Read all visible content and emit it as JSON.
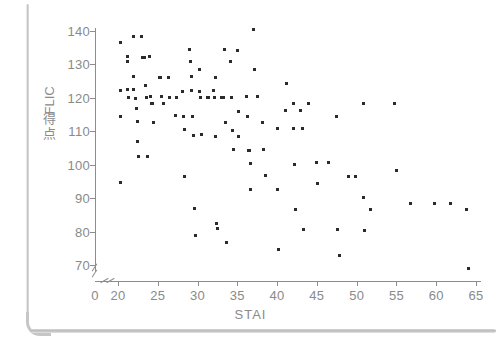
{
  "figure": {
    "background_color": "#ffffff",
    "axis_color": "#8d8d8d",
    "point_color": "#2b2b2b",
    "tick_label_color": "#8a8a8a"
  },
  "y_axis_title": {
    "rotated_part": "FLIC",
    "plain_part": "得点"
  },
  "chart_data": {
    "type": "scatter",
    "title": "",
    "subtitle": "",
    "xlabel": "STAI",
    "ylabel": "FLIC得点",
    "xlim": [
      0,
      65
    ],
    "ylim": [
      66,
      142
    ],
    "x_ticks": [
      0,
      20,
      25,
      30,
      35,
      40,
      45,
      50,
      55,
      60,
      65
    ],
    "y_ticks": [
      70,
      80,
      90,
      100,
      110,
      120,
      130,
      140
    ],
    "x_axis_break": true,
    "y_axis_break": true,
    "grid": false,
    "legend": false,
    "marker": "square-dot",
    "points": [
      [
        20.3,
        136.5
      ],
      [
        20.3,
        122.3
      ],
      [
        20.3,
        114.3
      ],
      [
        20.3,
        94.6
      ],
      [
        21.2,
        132.5
      ],
      [
        21.2,
        131.0
      ],
      [
        21.2,
        122.5
      ],
      [
        21.3,
        120.2
      ],
      [
        22.0,
        138.5
      ],
      [
        22.0,
        126.3
      ],
      [
        22.0,
        122.5
      ],
      [
        22.2,
        119.8
      ],
      [
        22.3,
        116.8
      ],
      [
        22.4,
        112.8
      ],
      [
        22.5,
        106.8
      ],
      [
        22.6,
        102.5
      ],
      [
        23.0,
        138.5
      ],
      [
        23.1,
        132.0
      ],
      [
        23.3,
        132.0
      ],
      [
        23.5,
        123.8
      ],
      [
        23.6,
        120.0
      ],
      [
        23.7,
        102.5
      ],
      [
        24.0,
        132.5
      ],
      [
        24.1,
        120.3
      ],
      [
        24.2,
        118.2
      ],
      [
        24.3,
        118.2
      ],
      [
        24.4,
        112.6
      ],
      [
        25.2,
        126.0
      ],
      [
        25.4,
        126.0
      ],
      [
        25.5,
        120.3
      ],
      [
        25.7,
        118.3
      ],
      [
        26.3,
        126.2
      ],
      [
        26.5,
        120.2
      ],
      [
        27.2,
        114.6
      ],
      [
        27.4,
        120.0
      ],
      [
        28.1,
        122.0
      ],
      [
        28.2,
        114.5
      ],
      [
        28.3,
        110.4
      ],
      [
        28.4,
        96.5
      ],
      [
        29.0,
        134.4
      ],
      [
        29.1,
        130.8
      ],
      [
        29.2,
        126.3
      ],
      [
        29.3,
        122.2
      ],
      [
        29.4,
        114.5
      ],
      [
        29.5,
        108.6
      ],
      [
        29.6,
        86.8
      ],
      [
        29.7,
        78.7
      ],
      [
        30.2,
        128.5
      ],
      [
        30.3,
        122.0
      ],
      [
        30.4,
        120.0
      ],
      [
        30.5,
        109.0
      ],
      [
        31.3,
        120.0
      ],
      [
        31.4,
        120.1
      ],
      [
        32.0,
        122.2
      ],
      [
        32.1,
        120.0
      ],
      [
        32.2,
        126.2
      ],
      [
        32.3,
        108.5
      ],
      [
        32.4,
        82.3
      ],
      [
        32.5,
        80.8
      ],
      [
        33.0,
        120.1
      ],
      [
        33.2,
        120.0
      ],
      [
        33.4,
        134.5
      ],
      [
        33.5,
        112.7
      ],
      [
        33.6,
        76.6
      ],
      [
        34.2,
        131.0
      ],
      [
        34.3,
        120.0
      ],
      [
        34.4,
        110.2
      ],
      [
        34.5,
        104.6
      ],
      [
        35.0,
        134.3
      ],
      [
        35.1,
        115.8
      ],
      [
        35.2,
        108.5
      ],
      [
        36.2,
        120.5
      ],
      [
        36.3,
        114.5
      ],
      [
        36.4,
        104.4
      ],
      [
        36.5,
        104.3
      ],
      [
        36.6,
        100.5
      ],
      [
        36.7,
        92.5
      ],
      [
        37.0,
        140.5
      ],
      [
        37.2,
        128.5
      ],
      [
        37.5,
        120.4
      ],
      [
        38.2,
        112.7
      ],
      [
        38.3,
        104.7
      ],
      [
        38.5,
        96.8
      ],
      [
        40.0,
        110.8
      ],
      [
        40.1,
        92.5
      ],
      [
        40.2,
        74.5
      ],
      [
        41.0,
        116.3
      ],
      [
        41.2,
        124.3
      ],
      [
        42.0,
        118.3
      ],
      [
        42.1,
        110.8
      ],
      [
        42.2,
        100.2
      ],
      [
        42.3,
        86.7
      ],
      [
        43.0,
        116.2
      ],
      [
        43.2,
        110.8
      ],
      [
        43.3,
        80.6
      ],
      [
        44.0,
        118.3
      ],
      [
        45.0,
        100.7
      ],
      [
        45.1,
        94.5
      ],
      [
        46.5,
        100.6
      ],
      [
        47.5,
        114.5
      ],
      [
        47.6,
        80.7
      ],
      [
        47.8,
        72.8
      ],
      [
        49.0,
        96.5
      ],
      [
        49.8,
        96.5
      ],
      [
        50.8,
        118.2
      ],
      [
        50.9,
        90.3
      ],
      [
        51.0,
        80.2
      ],
      [
        51.8,
        86.5
      ],
      [
        54.8,
        118.3
      ],
      [
        55.0,
        98.3
      ],
      [
        56.8,
        88.4
      ],
      [
        59.8,
        88.4
      ],
      [
        61.8,
        88.4
      ],
      [
        63.8,
        86.5
      ],
      [
        64.0,
        69.0
      ]
    ]
  }
}
